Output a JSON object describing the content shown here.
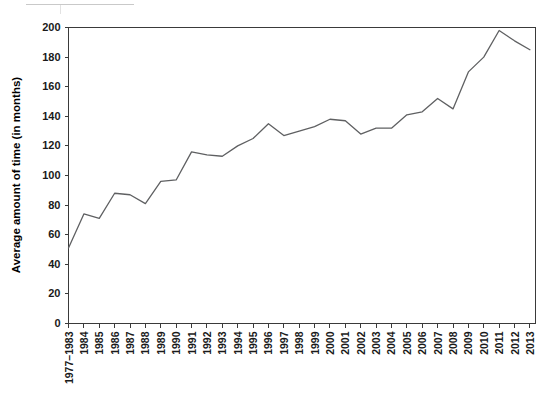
{
  "chart_data": {
    "type": "line",
    "title": "",
    "xlabel": "",
    "ylabel": "Average amount of time (in months)",
    "ylim": [
      0,
      200
    ],
    "ytick_values": [
      0,
      20,
      40,
      60,
      80,
      100,
      120,
      140,
      160,
      180,
      200
    ],
    "ytick_labels": [
      "0",
      "20",
      "40",
      "60",
      "80",
      "100",
      "120",
      "140",
      "160",
      "180",
      "200"
    ],
    "grid": false,
    "legend": "none",
    "line_color": "#5f6062",
    "axis_color": "#3a3a3a",
    "categories": [
      "1977–1983",
      "1984",
      "1985",
      "1986",
      "1987",
      "1988",
      "1989",
      "1990",
      "1991",
      "1992",
      "1993",
      "1994",
      "1995",
      "1996",
      "1997",
      "1998",
      "1999",
      "2000",
      "2001",
      "2002",
      "2003",
      "2004",
      "2005",
      "2006",
      "2007",
      "2008",
      "2009",
      "2010",
      "2011",
      "2012",
      "2013"
    ],
    "values": [
      51,
      74,
      71,
      88,
      87,
      81,
      96,
      97,
      116,
      114,
      113,
      120,
      125,
      135,
      127,
      130,
      133,
      138,
      137,
      128,
      132,
      132,
      141,
      143,
      152,
      145,
      170,
      180,
      198,
      191,
      185
    ]
  },
  "axes": {
    "ytick_label_prefix": "",
    "xtick_rotation": "-90"
  }
}
